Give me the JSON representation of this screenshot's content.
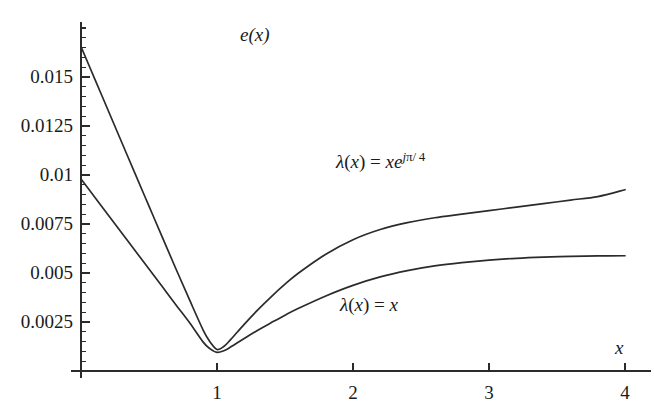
{
  "chart_data": {
    "type": "line",
    "title": "",
    "ylabel": "e(x)",
    "xlabel": "x",
    "xlim": [
      0,
      4.12
    ],
    "ylim": [
      0,
      0.0178
    ],
    "grid": false,
    "legend": "inline-annotations",
    "x_ticks": [
      {
        "value": 1,
        "label": "1"
      },
      {
        "value": 2,
        "label": "2"
      },
      {
        "value": 3,
        "label": "3"
      },
      {
        "value": 4,
        "label": "4"
      }
    ],
    "y_ticks": [
      {
        "value": 0.0025,
        "label": "0.0025"
      },
      {
        "value": 0.005,
        "label": "0.005"
      },
      {
        "value": 0.0075,
        "label": "0.0075"
      },
      {
        "value": 0.01,
        "label": "0.01"
      },
      {
        "value": 0.0125,
        "label": "0.0125"
      },
      {
        "value": 0.015,
        "label": "0.015"
      }
    ],
    "y_minor_tick_step": 0.0005,
    "series": [
      {
        "name": "lambda(x) = x e^{j pi / 4}",
        "label_html": "<span class=\"it\">λ</span>(<span class=\"it\">x</span>) = <span class=\"it\">xe</span><sup><span class=\"it\">j</span>π/ 4</sup>",
        "color": "#2b2b2b",
        "x": [
          0.0,
          0.1,
          0.2,
          0.3,
          0.4,
          0.5,
          0.6,
          0.7,
          0.8,
          0.9,
          0.95,
          1.0,
          1.05,
          1.1,
          1.2,
          1.3,
          1.4,
          1.5,
          1.6,
          1.8,
          2.0,
          2.2,
          2.4,
          2.6,
          2.8,
          3.0,
          3.2,
          3.4,
          3.6,
          3.8,
          4.0
        ],
        "y": [
          0.01655,
          0.01492,
          0.01329,
          0.01166,
          0.01003,
          0.00841,
          0.00679,
          0.00518,
          0.0036,
          0.00206,
          0.00147,
          0.0011,
          0.00125,
          0.0016,
          0.00238,
          0.00312,
          0.0038,
          0.00443,
          0.005,
          0.00596,
          0.0067,
          0.00722,
          0.00757,
          0.00782,
          0.008,
          0.00818,
          0.00836,
          0.00854,
          0.00872,
          0.0089,
          0.00925
        ]
      },
      {
        "name": "lambda(x) = x",
        "label_html": "<span class=\"it\">λ</span>(<span class=\"it\">x</span>) = <span class=\"it\">x</span>",
        "color": "#2b2b2b",
        "x": [
          0.0,
          0.1,
          0.2,
          0.3,
          0.4,
          0.5,
          0.6,
          0.7,
          0.8,
          0.9,
          0.95,
          1.0,
          1.05,
          1.1,
          1.2,
          1.3,
          1.4,
          1.5,
          1.6,
          1.8,
          2.0,
          2.2,
          2.4,
          2.6,
          2.8,
          3.0,
          3.2,
          3.4,
          3.6,
          3.8,
          4.0
        ],
        "y": [
          0.0098,
          0.00888,
          0.00796,
          0.00704,
          0.00612,
          0.0052,
          0.00428,
          0.00336,
          0.00245,
          0.00146,
          0.00113,
          0.00095,
          0.00103,
          0.00122,
          0.00166,
          0.00208,
          0.00247,
          0.00285,
          0.0032,
          0.00383,
          0.00437,
          0.0048,
          0.00512,
          0.00536,
          0.00553,
          0.00566,
          0.00575,
          0.00581,
          0.00585,
          0.00587,
          0.00588
        ]
      }
    ],
    "annotations": [
      {
        "text": "e(x)",
        "role": "y-axis-name",
        "x_px": 240,
        "y_px": 25
      },
      {
        "text": "x",
        "role": "x-axis-name",
        "x_px": 615,
        "y_px": 338
      }
    ]
  }
}
